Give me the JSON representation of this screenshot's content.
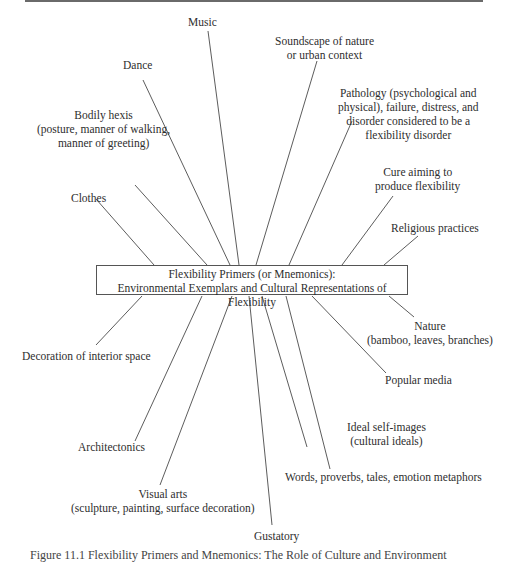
{
  "center": {
    "line1": "Flexibility Primers (or Mnemonics):",
    "line2": "Environmental Exemplars and Cultural Representations of Flexibility"
  },
  "nodes": [
    {
      "id": "music",
      "lines": [
        "Music"
      ]
    },
    {
      "id": "soundscape",
      "lines": [
        "Soundscape of nature",
        "or urban context"
      ]
    },
    {
      "id": "dance",
      "lines": [
        "Dance"
      ]
    },
    {
      "id": "pathology",
      "lines": [
        "Pathology (psychological and",
        "physical), failure, distress, and",
        "disorder considered to be a",
        "flexibility disorder"
      ]
    },
    {
      "id": "bodily",
      "lines": [
        "Bodily hexis",
        "(posture, manner of walking,",
        "manner of greeting)"
      ]
    },
    {
      "id": "cure",
      "lines": [
        "Cure aiming to",
        "produce flexibility"
      ]
    },
    {
      "id": "clothes",
      "lines": [
        "Clothes"
      ]
    },
    {
      "id": "religious",
      "lines": [
        "Religious practices"
      ]
    },
    {
      "id": "nature",
      "lines": [
        "Nature",
        "(bamboo, leaves, branches)"
      ]
    },
    {
      "id": "decoration",
      "lines": [
        "Decoration of interior space"
      ]
    },
    {
      "id": "popular",
      "lines": [
        "Popular media"
      ]
    },
    {
      "id": "ideal",
      "lines": [
        "Ideal self-images",
        "(cultural ideals)"
      ]
    },
    {
      "id": "architectonics",
      "lines": [
        "Architectonics"
      ]
    },
    {
      "id": "words",
      "lines": [
        "Words, proverbs, tales, emotion metaphors"
      ]
    },
    {
      "id": "visual",
      "lines": [
        "Visual arts",
        "(sculpture, painting, surface decoration)"
      ]
    },
    {
      "id": "gustatory",
      "lines": [
        "Gustatory"
      ]
    }
  ],
  "caption": "Figure 11.1 Flexibility Primers and Mnemonics: The Role of Culture and Environment",
  "colors": {
    "line": "#4a4a4a",
    "text": "#2e2e2e",
    "background": "#ffffff"
  }
}
